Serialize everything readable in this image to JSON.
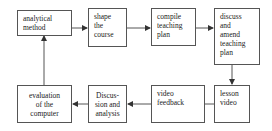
{
  "diagram": {
    "type": "flowchart",
    "nodes": [
      {
        "id": "n1",
        "lines": [
          "analytical",
          "method"
        ]
      },
      {
        "id": "n2",
        "lines": [
          "shape",
          "the",
          "course"
        ]
      },
      {
        "id": "n3",
        "lines": [
          "compile",
          "teaching",
          "plan"
        ]
      },
      {
        "id": "n4",
        "lines": [
          "discuss",
          "and",
          "amend",
          "teaching",
          "plan"
        ]
      },
      {
        "id": "n5",
        "lines": [
          "lesson",
          "video"
        ]
      },
      {
        "id": "n6",
        "lines": [
          "video",
          "feedback"
        ]
      },
      {
        "id": "n7",
        "lines": [
          "Discus-",
          "sion and",
          "analysis"
        ]
      },
      {
        "id": "n8",
        "lines": [
          "evaluation",
          "of the",
          "computer"
        ]
      }
    ],
    "edges": [
      {
        "from": "n1",
        "to": "n2"
      },
      {
        "from": "n2",
        "to": "n3"
      },
      {
        "from": "n3",
        "to": "n4"
      },
      {
        "from": "n4",
        "to": "n5"
      },
      {
        "from": "n5",
        "to": "n6"
      },
      {
        "from": "n6",
        "to": "n7"
      },
      {
        "from": "n7",
        "to": "n8"
      },
      {
        "from": "n8",
        "to": "n1"
      }
    ],
    "colors": {
      "stroke": "#555555",
      "text": "#222222",
      "background": "#ffffff"
    }
  }
}
